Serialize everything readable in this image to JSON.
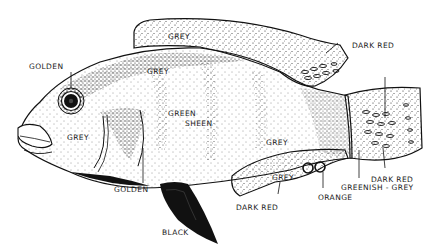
{
  "figure": {
    "labels": {
      "golden_top": "GOLDEN",
      "grey_dorsal_fin": "GREY",
      "grey_upper_body": "GREY",
      "dark_red_dorsal": "DARK RED",
      "grey_head": "GREY",
      "green_sheen_line1": "GREEN",
      "green_sheen_line2": "SHEEN",
      "grey_mid_body": "GREY",
      "grey_anal_fin": "GREY",
      "golden_bottom": "GOLDEN",
      "dark_red_tail": "DARK RED",
      "greenish_grey": "GREENISH - GREY",
      "orange": "ORANGE",
      "dark_red_anal": "DARK RED",
      "black": "BLACK"
    },
    "colors": {
      "ink": "#111111",
      "paper": "#ffffff"
    }
  }
}
